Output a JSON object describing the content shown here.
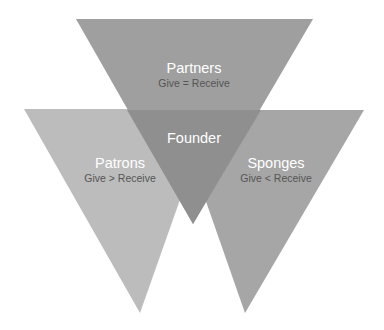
{
  "diagram": {
    "type": "overlapping-inverted-triangles",
    "colors": {
      "partners": "#9f9f9f",
      "patrons": "#bcbcbc",
      "sponges": "#a6a6a6",
      "founder_overlap": "#8e8e8e",
      "title_text": "#ffffff",
      "sub_text": "#555555"
    },
    "shapes": {
      "partners": {
        "title": "Partners",
        "subtitle": "Give = Receive"
      },
      "patrons": {
        "title": "Patrons",
        "subtitle": "Give > Receive"
      },
      "sponges": {
        "title": "Sponges",
        "subtitle": "Give < Receive"
      },
      "founder": {
        "title": "Founder"
      }
    }
  }
}
